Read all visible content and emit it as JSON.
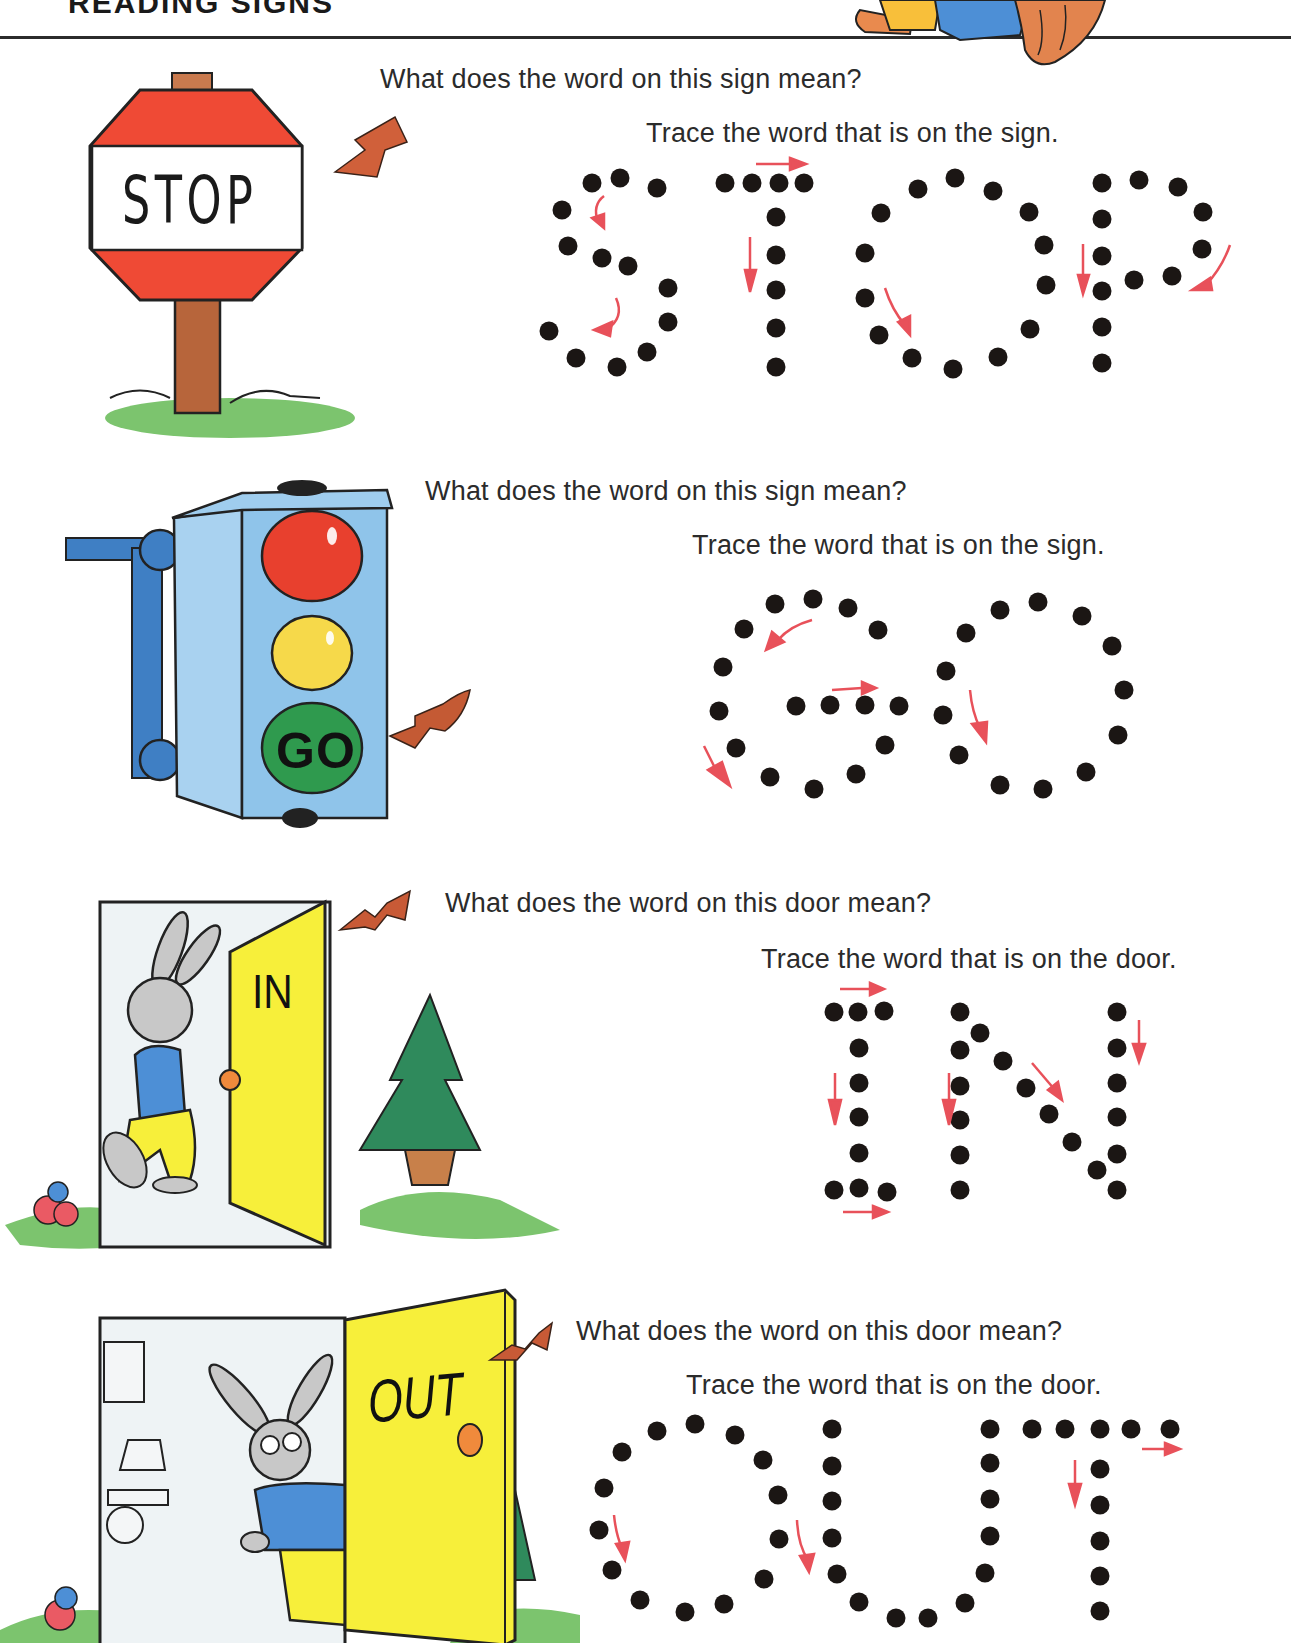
{
  "page": {
    "title": "READING SIGNS"
  },
  "colors": {
    "guide_arrow": "#e8515a",
    "pointer_arrow": "#d0603a",
    "dot": "#1b1614",
    "stop_red": "#ef4a35",
    "light_red": "#e8402e",
    "light_yellow": "#f6d94a",
    "light_green": "#2f9a4e",
    "door_yellow": "#f7ef3a",
    "signal_blue": "#8fc4ea",
    "grass_green": "#76c26a"
  },
  "sections": [
    {
      "id": "stop",
      "illustration": "stop-sign",
      "sign_word": "STOP",
      "question": "What does the word on this sign mean?",
      "instruction": "Trace the word that is on the sign.",
      "trace_word": "STOP"
    },
    {
      "id": "go",
      "illustration": "traffic-light",
      "sign_word": "GO",
      "question": "What does the word on this sign mean?",
      "instruction": "Trace the word that is on the sign.",
      "trace_word": "GO"
    },
    {
      "id": "in",
      "illustration": "rabbit-entering-door",
      "sign_word": "IN",
      "question": "What does the word on this door mean?",
      "instruction": "Trace the word that is on the door.",
      "trace_word": "IN"
    },
    {
      "id": "out",
      "illustration": "rabbit-exiting-door",
      "sign_word": "OUT",
      "question": "What does the word on this door mean?",
      "instruction": "Trace the word that is on the door.",
      "trace_word": "OUT"
    }
  ]
}
